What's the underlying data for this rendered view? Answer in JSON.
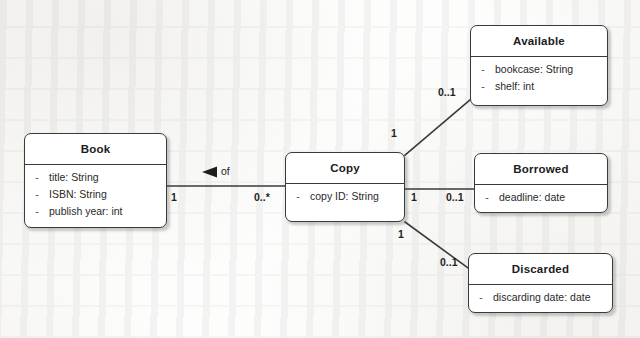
{
  "diagram": {
    "type": "uml-class-diagram",
    "classes": [
      {
        "id": "book",
        "name": "Book",
        "attributes": [
          {
            "visibility": "-",
            "text": "title: String"
          },
          {
            "visibility": "-",
            "text": "ISBN: String"
          },
          {
            "visibility": "-",
            "text": "publish year: int"
          }
        ]
      },
      {
        "id": "copy",
        "name": "Copy",
        "attributes": [
          {
            "visibility": "-",
            "text": "copy ID: String"
          }
        ]
      },
      {
        "id": "available",
        "name": "Available",
        "attributes": [
          {
            "visibility": "-",
            "text": "bookcase: String"
          },
          {
            "visibility": "-",
            "text": "shelf: int"
          }
        ]
      },
      {
        "id": "borrowed",
        "name": "Borrowed",
        "attributes": [
          {
            "visibility": "-",
            "text": "deadline: date"
          }
        ]
      },
      {
        "id": "discarded",
        "name": "Discarded",
        "attributes": [
          {
            "visibility": "-",
            "text": "discarding date: date"
          }
        ]
      }
    ],
    "associations": [
      {
        "id": "book-copy",
        "label": "of",
        "source": "book",
        "target": "copy",
        "source_multiplicity": "1",
        "target_multiplicity": "0..*",
        "direction_marker": "filled-triangle-left"
      },
      {
        "id": "copy-available",
        "source": "copy",
        "target": "available",
        "source_multiplicity": "1",
        "target_multiplicity": "0..1"
      },
      {
        "id": "copy-borrowed",
        "source": "copy",
        "target": "borrowed",
        "source_multiplicity": "1",
        "target_multiplicity": "0..1"
      },
      {
        "id": "copy-discarded",
        "source": "copy",
        "target": "discarded",
        "source_multiplicity": "1",
        "target_multiplicity": "0..1"
      }
    ],
    "colors": {
      "line": "#3a3a3a",
      "box_fill": "#ffffff",
      "text": "#1c1c1c",
      "page": "#fdfdfc"
    }
  }
}
